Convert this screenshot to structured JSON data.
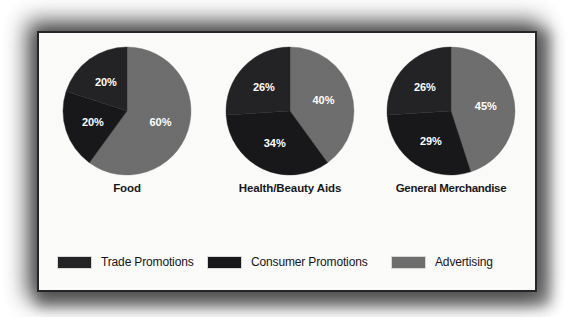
{
  "figure": {
    "background_color": "#ffffff",
    "panel_color": "#fbfbfa",
    "border_color": "#26262a"
  },
  "chart_data": {
    "type": "pie",
    "title": "",
    "subtitle": "",
    "xlabel": "",
    "ylabel": "",
    "legend_position": "bottom",
    "grid": false,
    "units": "percent",
    "categories": [
      "Trade Promotions",
      "Consumer Promotions",
      "Advertising"
    ],
    "colors": [
      "#232326",
      "#18181a",
      "#6e6e6e"
    ],
    "charts": [
      {
        "title": "Food",
        "labels": [
          "Trade Promotions",
          "Consumer Promotions",
          "Advertising"
        ],
        "values": [
          20,
          20,
          60
        ],
        "value_labels": [
          "20%",
          "20%",
          "60%"
        ]
      },
      {
        "title": "Health/Beauty Aids",
        "labels": [
          "Trade Promotions",
          "Consumer Promotions",
          "Advertising"
        ],
        "values": [
          26,
          34,
          40
        ],
        "value_labels": [
          "26%",
          "34%",
          "40%"
        ]
      },
      {
        "title": "General Merchandise",
        "labels": [
          "Trade Promotions",
          "Consumer Promotions",
          "Advertising"
        ],
        "values": [
          26,
          29,
          45
        ],
        "value_labels": [
          "26%",
          "29%",
          "45%"
        ]
      }
    ]
  },
  "legend": {
    "items": [
      {
        "label": "Trade Promotions",
        "color": "#232326"
      },
      {
        "label": "Consumer Promotions",
        "color": "#18181a"
      },
      {
        "label": "Advertising",
        "color": "#6e6e6e"
      }
    ]
  }
}
